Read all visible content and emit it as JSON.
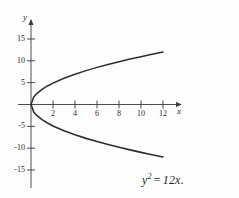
{
  "figure": {
    "background_color": "#fdfdfd",
    "ink_color": "#3a3a3a",
    "curve_color": "#2f2f2f"
  },
  "axes": {
    "x_axis_label": "x",
    "y_axis_label": "y",
    "origin_px": {
      "x": 31,
      "y": 104.5
    },
    "x_scale_px_per_unit": 11.0,
    "y_scale_px_per_unit": 4.37,
    "x_ticks": [
      2,
      4,
      6,
      8,
      10,
      12
    ],
    "x_tick_labels": [
      "2",
      "4",
      "6",
      "8",
      "10",
      "12"
    ],
    "y_ticks": [
      15,
      10,
      5,
      -5,
      -10,
      -15
    ],
    "y_tick_labels": [
      "15",
      "10",
      "5",
      "-5",
      "-10",
      "-15"
    ],
    "x_axis_arrow_end_px": 185,
    "y_axis_arrow_end_px": 16,
    "y_axis_bottom_px": 188,
    "grid": false,
    "legend": null
  },
  "caption": {
    "equation_base": "y",
    "equation_exponent": "2",
    "equation_operator": "=",
    "equation_right": "12x.",
    "equation_plain": "y^2 = 12x."
  },
  "chart_data": {
    "type": "line",
    "title": "",
    "subtitle": "",
    "xlabel": "x",
    "ylabel": "y",
    "xlim": [
      0,
      14
    ],
    "ylim": [
      -16,
      16
    ],
    "grid": false,
    "legend_position": "none",
    "annotations": [
      "y^2 = 12x."
    ],
    "series": [
      {
        "name": "y = +sqrt(12x)",
        "x": [
          0,
          0.25,
          0.5,
          1,
          1.5,
          2,
          3,
          4,
          5,
          6,
          7,
          8,
          9,
          10,
          11,
          12
        ],
        "values": [
          0,
          1.73,
          2.45,
          3.46,
          4.24,
          4.9,
          6.0,
          6.93,
          7.75,
          8.49,
          9.17,
          9.8,
          10.39,
          10.95,
          11.49,
          12.0
        ]
      },
      {
        "name": "y = -sqrt(12x)",
        "x": [
          0,
          0.25,
          0.5,
          1,
          1.5,
          2,
          3,
          4,
          5,
          6,
          7,
          8,
          9,
          10,
          11,
          12
        ],
        "values": [
          0,
          -1.73,
          -2.45,
          -3.46,
          -4.24,
          -4.9,
          -6.0,
          -6.93,
          -7.75,
          -8.49,
          -9.17,
          -9.8,
          -10.39,
          -10.95,
          -11.49,
          -12.0
        ]
      }
    ]
  }
}
